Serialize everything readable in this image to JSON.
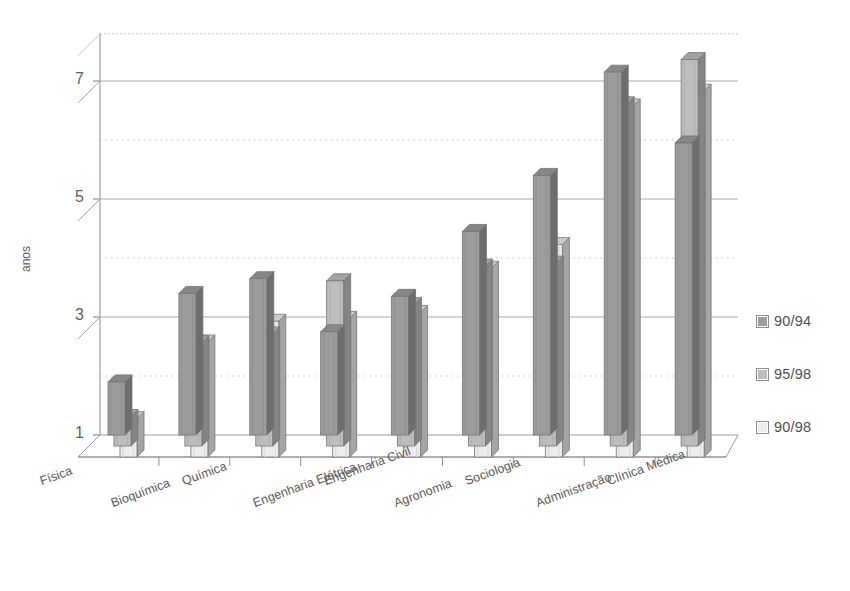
{
  "title": "",
  "y_axis": {
    "label": "anos",
    "ticks": [
      "1",
      "3",
      "5",
      "7"
    ]
  },
  "legend": {
    "items": [
      {
        "label": "90/94",
        "color": "#9c9c9c"
      },
      {
        "label": "95/98",
        "color": "#bdbdbd"
      },
      {
        "label": "90/98",
        "color": "#ececec"
      }
    ]
  },
  "chart_data": {
    "type": "bar",
    "title": "",
    "xlabel": "",
    "ylabel": "anos",
    "ylim": [
      1,
      7.8
    ],
    "yticks": [
      1,
      3,
      5,
      7
    ],
    "grid": true,
    "legend_position": "right",
    "categories": [
      "Física",
      "Bioquímica",
      "Química",
      "Engenharia Elétrica",
      "Engenharia Civil",
      "Agronomia",
      "Sociologia",
      "Administração",
      "Clínica Médica"
    ],
    "series": [
      {
        "name": "90/94",
        "color": "#9c9c9c",
        "values": [
          1.9,
          3.4,
          3.65,
          2.75,
          3.35,
          4.45,
          5.4,
          7.15,
          5.95
        ]
      },
      {
        "name": "95/98",
        "color": "#bdbdbd",
        "values": [
          1.5,
          2.75,
          2.9,
          3.8,
          3.4,
          4.05,
          4.1,
          6.8,
          7.55
        ]
      },
      {
        "name": "90/98",
        "color": "#ececec",
        "values": [
          1.65,
          2.95,
          3.3,
          3.35,
          3.45,
          4.2,
          4.6,
          6.95,
          7.2
        ]
      }
    ]
  }
}
